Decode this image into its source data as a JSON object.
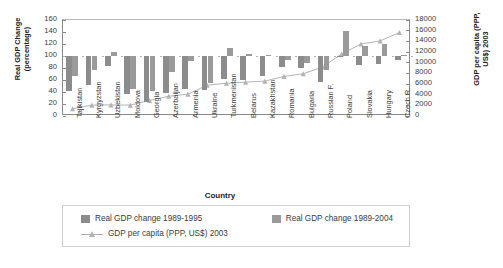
{
  "chart_data": {
    "type": "bar",
    "title": "",
    "xlabel": "Country",
    "ylabel": "Real GDP Change (percentage)",
    "ylabel2": "GDP per capita (PPP, US$) 2003",
    "ylim": [
      0,
      160
    ],
    "ylim2": [
      0,
      18000
    ],
    "ytick_step": 20,
    "ytick2_step": 2000,
    "grid": false,
    "legend_position": "bottom",
    "baseline": 100,
    "categories": [
      "Tajikistan",
      "Kyrgyzstan",
      "Uzbekistan",
      "Moldova",
      "Georgia",
      "Azerbaijan",
      "Armenia",
      "Ukraine",
      "Turkmenistan",
      "Belarus",
      "Kazakhstan",
      "Romania",
      "Bulgaria",
      "Russian F.",
      "Poland",
      "Slovakia",
      "Hungary",
      "Czech R."
    ],
    "yticks": [
      "160",
      "140",
      "120",
      "100",
      "80",
      "60",
      "40",
      "20",
      "0"
    ],
    "yticks2": [
      "18000",
      "16000",
      "14000",
      "12000",
      "10000",
      "8000",
      "6000",
      "4000",
      "2000",
      "0"
    ],
    "series": [
      {
        "name": "Real GDP change 1989-1995",
        "type": "bar",
        "axis": "left",
        "color": "#8c8c8c",
        "values": [
          41,
          51,
          84,
          36,
          23,
          38,
          45,
          43,
          62,
          60,
          67,
          82,
          80,
          57,
          98,
          85,
          86,
          94
        ]
      },
      {
        "name": "Real GDP change 1989-2004",
        "type": "bar",
        "axis": "left",
        "color": "#9a9a9a",
        "values": [
          67,
          76,
          106,
          45,
          41,
          74,
          91,
          55,
          113,
          103,
          101,
          94,
          88,
          77,
          141,
          116,
          120,
          102
        ]
      },
      {
        "name": "GDP per capita (PPP, US$) 2003",
        "type": "line",
        "axis": "right",
        "color": "#b3b3b3",
        "marker": "triangle",
        "values": [
          1000,
          1700,
          1750,
          1700,
          2600,
          3400,
          3800,
          5500,
          5900,
          6100,
          6300,
          7200,
          7700,
          9000,
          11500,
          13400,
          14000,
          15600
        ]
      }
    ],
    "legend": [
      {
        "label": "Real GDP change 1989-1995",
        "swatch": "bar",
        "color": "#8c8c8c"
      },
      {
        "label": "Real GDP change 1989-2004",
        "swatch": "bar",
        "color": "#9a9a9a"
      },
      {
        "label": "GDP per capita (PPP, US$) 2003",
        "swatch": "line-triangle",
        "color": "#b3b3b3"
      }
    ]
  }
}
